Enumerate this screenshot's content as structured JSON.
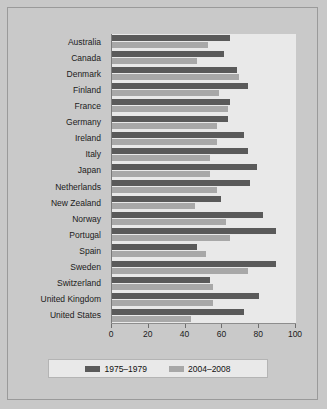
{
  "chart_data": {
    "type": "bar",
    "orientation": "horizontal",
    "title": "",
    "xlabel": "",
    "ylabel": "",
    "xlim": [
      0,
      100
    ],
    "grid": false,
    "legend_position": "bottom",
    "xticks": [
      0,
      20,
      40,
      60,
      80,
      100
    ],
    "categories": [
      "Australia",
      "Canada",
      "Denmark",
      "Finland",
      "France",
      "Germany",
      "Ireland",
      "Italy",
      "Japan",
      "Netherlands",
      "New Zealand",
      "Norway",
      "Portugal",
      "Spain",
      "Sweden",
      "Switzerland",
      "United Kingdom",
      "United States"
    ],
    "series": [
      {
        "name": "1975–1979",
        "color": "#5a5a5a",
        "values": [
          64,
          61,
          68,
          74,
          64,
          63,
          72,
          74,
          79,
          75,
          59,
          82,
          89,
          46,
          89,
          53,
          80,
          72
        ]
      },
      {
        "name": "2004–2008",
        "color": "#a8a8a8",
        "values": [
          52,
          46,
          69,
          58,
          63,
          57,
          57,
          53,
          53,
          57,
          45,
          62,
          64,
          51,
          74,
          55,
          55,
          43
        ]
      }
    ]
  },
  "colors": {
    "figure_background": "#c9c9c9",
    "plot_background": "#e9e9e9",
    "border": "#9a9a9a",
    "axis": "#7b7b7b",
    "text": "#1b1b1b"
  }
}
